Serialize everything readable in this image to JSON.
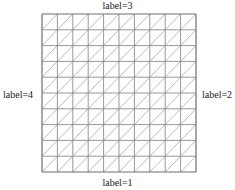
{
  "diagram": {
    "type": "triangulated-square-mesh",
    "rows": 10,
    "cols": 10,
    "diagonal": "bottom-left-to-top-right",
    "line_color": "#8c8c8c",
    "boundary_color": "#6e6e6e",
    "labels": {
      "top": "label=3",
      "bottom": "label=1",
      "left": "label=4",
      "right": "label=2"
    }
  }
}
